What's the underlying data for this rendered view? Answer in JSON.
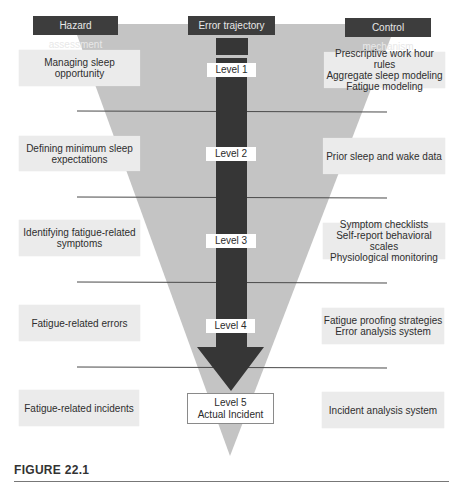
{
  "headers": {
    "left": "Hazard assessment",
    "center": "Error trajectory",
    "right": "Control mechanism"
  },
  "levels": [
    {
      "label": "Level 1",
      "hazard": "Managing sleep opportunity",
      "control": "Prescriptive work hour rules\nAggregate sleep modeling\nFatigue modeling"
    },
    {
      "label": "Level 2",
      "hazard": "Defining minimum sleep\nexpectations",
      "control": "Prior sleep and wake data"
    },
    {
      "label": "Level 3",
      "hazard": "Identifying fatigue-related\nsymptoms",
      "control": "Symptom checklists\nSelf-report behavioral scales\nPhysiological monitoring"
    },
    {
      "label": "Level 4",
      "hazard": "Fatigue-related errors",
      "control": "Fatigue proofing strategies\nError analysis system"
    },
    {
      "label": "Level 5\nActual Incident",
      "hazard": "Fatigue-related incidents",
      "control": "Incident analysis system"
    }
  ],
  "caption": "FIGURE 22.1",
  "colors": {
    "funnel": "#c4c4c4",
    "arrow": "#363636",
    "header_bg": "#3d3d3d",
    "box_bg": "#ebebeb",
    "divider": "#4a4a4a"
  }
}
